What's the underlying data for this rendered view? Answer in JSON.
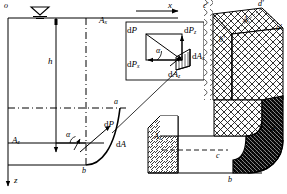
{
  "figure": {
    "type": "engineering-diagram",
    "width": 287,
    "height": 194,
    "stroke_color": "#000000",
    "background": "#ffffff"
  },
  "axes": {
    "origin_label": "o",
    "x_axis_label": "x",
    "z_axis_label": "z",
    "free_surface_symbol": "water-surface-triangle"
  },
  "plan_view": {
    "depth_label": "h",
    "vertical_projection_area": "A",
    "vertical_projection_area_sub": "x",
    "horizontal_projection_area": "A",
    "horizontal_projection_area_sub": "z",
    "curve_top_point": "a",
    "curve_bottom_point": "b",
    "force_label": "dP",
    "area_label": "dA",
    "angle_label": "α"
  },
  "detail_box": {
    "resultant_force": "dP",
    "vertical_component": "dP",
    "vertical_component_sub": "z",
    "horizontal_component": "dP",
    "horizontal_component_sub": "x",
    "area_element": "dA",
    "area_x_projection": "dA",
    "area_x_projection_sub": "x",
    "area_z_projection": "dA",
    "area_z_projection_sub": "z",
    "angle": "α"
  },
  "solid_upper": {
    "vertex_c_prime": "c′",
    "vertex_d_prime": "d′",
    "vertex_a_prime": "a′",
    "vertex_b_prime": "b′",
    "top_face_area": "A",
    "top_face_area_sub": "z",
    "hatch_pattern": "cross-hatch"
  },
  "solid_lower": {
    "side_face_area": "A",
    "side_face_area_sub": "x",
    "vertex_a": "a",
    "vertex_b": "b",
    "vertex_c": "c",
    "hatch_pattern": "diagonal-hatch"
  }
}
